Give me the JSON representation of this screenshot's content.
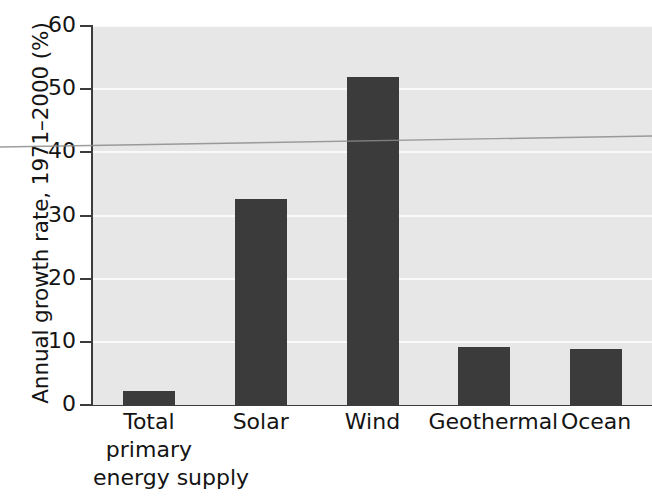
{
  "chart_data": {
    "type": "bar",
    "title": "",
    "xlabel": "",
    "ylabel": "Annual growth rate, 1971–2000 (%)",
    "categories": [
      "Total primary energy supply",
      "Solar",
      "Wind",
      "Geothermal",
      "Ocean"
    ],
    "category_lines": [
      [
        "Total",
        "primary",
        "energy supply"
      ],
      [
        "Solar"
      ],
      [
        "Wind"
      ],
      [
        "Geothermal"
      ],
      [
        "Ocean"
      ]
    ],
    "values": [
      2.2,
      32.6,
      52.0,
      9.2,
      8.9
    ],
    "ylim": [
      0,
      60
    ],
    "yticks": [
      0,
      10,
      20,
      30,
      40,
      50,
      60
    ],
    "ytick_labels": [
      "0",
      "10",
      "20",
      "30",
      "40",
      "50",
      "60"
    ],
    "grid": true,
    "grid_axis": "y",
    "legend": "none",
    "bar_color": "#3b3b3b",
    "plot_background": "#e7e7e7",
    "gridline_color": "#fafafa",
    "axis_color": "#3c3c3c",
    "annotations": [
      "scan-artifact-line"
    ]
  }
}
